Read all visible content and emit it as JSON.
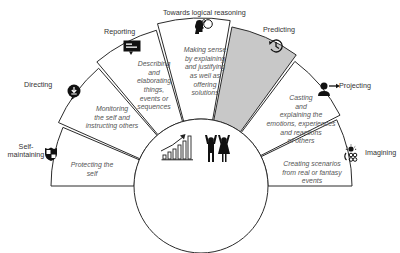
{
  "diagram": {
    "title": "Towards logical reasoning",
    "center": {
      "x": 201,
      "y": 186,
      "r": 67
    },
    "colors": {
      "stroke": "#2b2b2b",
      "highlight": "#c8c8c8",
      "background": "#ffffff",
      "label": "#333333",
      "description": "#555555"
    },
    "segments": [
      {
        "id": "self-maintaining",
        "label": "Self-\nmaintaining",
        "description": "Protecting the\nself",
        "icon": "shield-icon",
        "start": 180,
        "end": 157,
        "radius": 150,
        "highlighted": false
      },
      {
        "id": "directing",
        "label": "Directing",
        "description": "Monitoring\nthe self and\ninstructing others",
        "icon": "download-arrow-icon",
        "start": 156,
        "end": 131,
        "radius": 156,
        "highlighted": false
      },
      {
        "id": "reporting",
        "label": "Reporting",
        "description": "Describing\nand\nelaborating\nthings,\nevents or\nsequences",
        "icon": "speech-bubble-icon",
        "start": 130,
        "end": 106,
        "radius": 162,
        "highlighted": false
      },
      {
        "id": "logical-reasoning",
        "label": "Towards logical reasoning",
        "description": "Making sense\nby explaining\nand justifying\nas well as\noffering\nsolutions",
        "icon": "head-thought-icon",
        "start": 105,
        "end": 80,
        "radius": 168,
        "highlighted": false
      },
      {
        "id": "predicting",
        "label": "Predicting",
        "description": "",
        "icon": "clock-arrow-icon",
        "start": 79,
        "end": 54,
        "radius": 162,
        "highlighted": true
      },
      {
        "id": "projecting",
        "label": "Projecting",
        "description": "Casting\nand\nexplaining the\nemotions, experiences\nand reactions\nof others",
        "icon": "person-arrow-icon",
        "start": 53,
        "end": 27,
        "radius": 156,
        "highlighted": false
      },
      {
        "id": "imagining",
        "label": "Imagining",
        "description": "Creating scenarios\nfrom real or fantasy\nevents",
        "icon": "lightbulb-gears-icon",
        "start": 26,
        "end": 0,
        "radius": 151,
        "highlighted": false
      }
    ],
    "center_icons": [
      "growth-chart-icon",
      "celebrating-people-icon"
    ]
  }
}
